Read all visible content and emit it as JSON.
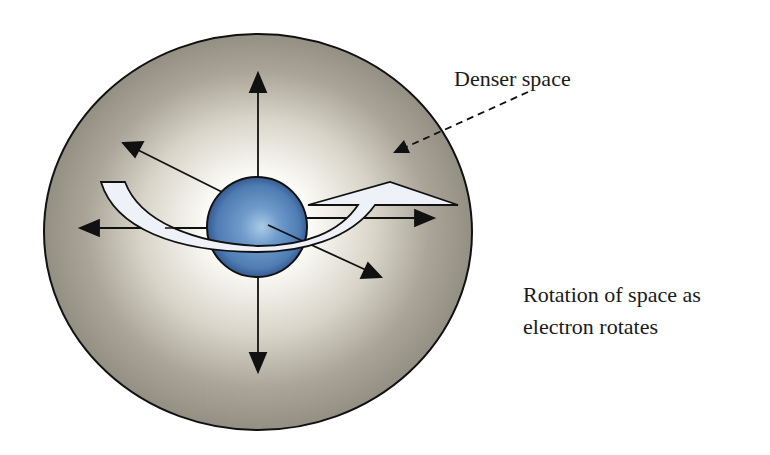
{
  "diagram": {
    "labels": {
      "denser_space": "Denser space",
      "rotation_line1": "Rotation of space as",
      "rotation_line2": "electron rotates"
    },
    "elements": {
      "outer_field": "Denser space region (radial gradient, white center to grey-taupe edge)",
      "electron": "Blue sphere at center",
      "radial_arrows": [
        "up",
        "down",
        "left",
        "right",
        "upper-left",
        "lower-right"
      ],
      "rotation_arrow": "White curved band arrow wrapping around the electron, pointing right",
      "pointer": "Dashed arrow from 'Denser space' label into the field"
    },
    "colors": {
      "field_center": "#ffffff",
      "field_edge": "#948f83",
      "electron_highlight": "#a9cbe6",
      "electron_mid": "#4f7db3",
      "electron_edge": "#27497f",
      "band_fill": "#eef1f7",
      "stroke": "#111111"
    }
  }
}
